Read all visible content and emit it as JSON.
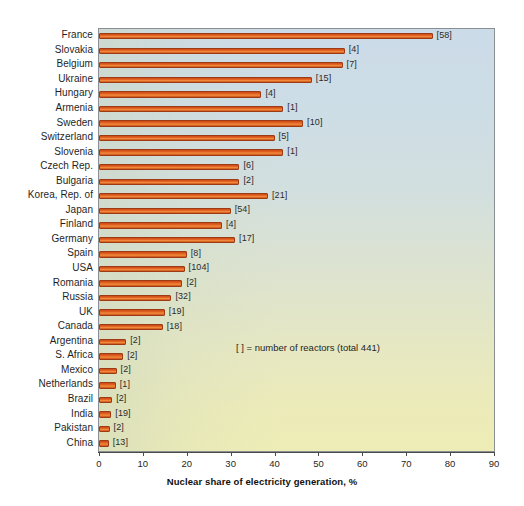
{
  "chart_data": {
    "type": "bar",
    "orientation": "horizontal",
    "title": "",
    "xlabel": "Nuclear share of electricity generation, %",
    "ylabel": "",
    "xlim": [
      0,
      90
    ],
    "xticks": [
      0,
      10,
      20,
      30,
      40,
      50,
      60,
      70,
      80,
      90
    ],
    "grid": false,
    "legend_position": "inside-right",
    "annotation": "[ ]  = number of reactors (total 441)",
    "value_label_format": "[reactors]",
    "categories": [
      "France",
      "Slovakia",
      "Belgium",
      "Ukraine",
      "Hungary",
      "Armenia",
      "Sweden",
      "Switzerland",
      "Slovenia",
      "Czech Rep.",
      "Bulgaria",
      "Korea, Rep. of",
      "Japan",
      "Finland",
      "Germany",
      "Spain",
      "USA",
      "Romania",
      "Russia",
      "UK",
      "Canada",
      "Argentina",
      "S. Africa",
      "Mexico",
      "Netherlands",
      "Brazil",
      "India",
      "Pakistan",
      "China"
    ],
    "values": [
      76.0,
      56.0,
      55.5,
      48.5,
      37.0,
      42.0,
      46.5,
      40.0,
      42.0,
      32.0,
      32.0,
      38.5,
      30.0,
      28.0,
      31.0,
      20.0,
      19.5,
      19.0,
      16.5,
      15.0,
      14.5,
      6.2,
      5.5,
      4.0,
      3.8,
      3.0,
      2.8,
      2.4,
      2.2
    ],
    "reactors": [
      58,
      4,
      7,
      15,
      4,
      1,
      10,
      5,
      1,
      6,
      2,
      21,
      54,
      4,
      17,
      8,
      104,
      2,
      32,
      19,
      18,
      2,
      2,
      2,
      1,
      2,
      19,
      2,
      13
    ],
    "series": [
      {
        "name": "Nuclear share of electricity generation, %",
        "color": "#e2601f"
      }
    ],
    "colors": {
      "bar_fill": "#e2601f",
      "bar_edge": "#9e3b14",
      "plot_bg_top": "#ccdbe8",
      "plot_bg_bottom": "#eeedb6",
      "text": "#1f1f1f",
      "axis": "#8a8f93"
    }
  }
}
